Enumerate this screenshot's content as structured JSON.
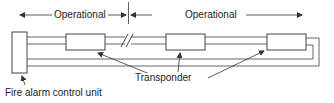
{
  "diagram": {
    "type": "addressable fire alarm loop wiring",
    "labels": {
      "operational_left": "Operational",
      "operational_right": "Operational",
      "transponder": "Transponder",
      "control_unit": "Fire alarm control unit"
    },
    "nodes": [
      {
        "id": "control-unit",
        "label": "Fire alarm control unit"
      },
      {
        "id": "transponder-1",
        "label": "Transponder"
      },
      {
        "id": "transponder-2",
        "label": "Transponder"
      },
      {
        "id": "transponder-3",
        "label": "Transponder"
      }
    ],
    "annotations": {
      "break_mark": "//",
      "section_divider": "vertical line between two operational sections"
    },
    "colors": {
      "line": "#555555",
      "text": "#222222",
      "background": "#ffffff"
    }
  }
}
